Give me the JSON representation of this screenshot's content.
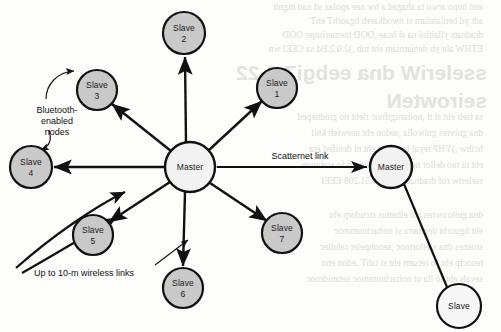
{
  "figure": {
    "name": "bluetooth-piconet-scatternet-diagram",
    "kind": "network-topology-diagram",
    "background_color": "#fdfdfc"
  },
  "colors": {
    "slave_fill": "#c9c9c9",
    "master_fill": "#f2f2f2",
    "node_stroke": "#111111",
    "link_stroke": "#111111",
    "text": "#111111",
    "bleed_text": "#dcdcd7"
  },
  "nodes": [
    {
      "id": "slave2",
      "line1": "Slave",
      "line2": "2",
      "cx": 184,
      "cy": 33,
      "r": 21,
      "role": "slave"
    },
    {
      "id": "slave1",
      "line1": "Slave",
      "line2": "1",
      "cx": 277,
      "cy": 88,
      "r": 20,
      "role": "slave"
    },
    {
      "id": "slave3",
      "line1": "Slave",
      "line2": "3",
      "cx": 97,
      "cy": 90,
      "r": 20,
      "role": "slave"
    },
    {
      "id": "slave4",
      "line1": "Slave",
      "line2": "4",
      "cx": 31,
      "cy": 167,
      "r": 21,
      "role": "slave"
    },
    {
      "id": "slave5",
      "line1": "Slave",
      "line2": "5",
      "cx": 93,
      "cy": 235,
      "r": 20,
      "role": "slave"
    },
    {
      "id": "slave6",
      "line1": "Slave",
      "line2": "6",
      "cx": 183,
      "cy": 288,
      "r": 20,
      "role": "slave"
    },
    {
      "id": "slave7",
      "line1": "Slave",
      "line2": "7",
      "cx": 282,
      "cy": 233,
      "r": 20,
      "role": "slave"
    },
    {
      "id": "master-left",
      "line1": "Master",
      "line2": "",
      "cx": 190,
      "cy": 167,
      "r": 25,
      "role": "master"
    },
    {
      "id": "master-right",
      "line1": "Master",
      "line2": "",
      "cx": 391,
      "cy": 167,
      "r": 21,
      "role": "master"
    },
    {
      "id": "slave-right",
      "line1": "Slave",
      "line2": "",
      "cx": 459,
      "cy": 306,
      "r": 22,
      "role": "slave-open"
    }
  ],
  "labels": {
    "master_left": "Master",
    "master_right": "Master",
    "slave_right": "Slave",
    "slave1_name": "Slave",
    "slave1_num": "1",
    "slave2_name": "Slave",
    "slave2_num": "2",
    "slave3_name": "Slave",
    "slave3_num": "3",
    "slave4_name": "Slave",
    "slave4_num": "4",
    "slave5_name": "Slave",
    "slave5_num": "5",
    "slave6_name": "Slave",
    "slave6_num": "6",
    "slave7_name": "Slave",
    "slave7_num": "7"
  },
  "annotations": {
    "bluetooth_nodes": {
      "line1": "Bluetooth-",
      "line2": "enabled",
      "line3": "nodes",
      "x": 57,
      "y": 110
    },
    "scatternet_link": {
      "text": "Scatternet link",
      "x": 300,
      "y": 158
    },
    "wireless_links": {
      "text": "Up to 10-m wireless links",
      "x": 34,
      "y": 273
    }
  },
  "links": [
    {
      "from": "master-left",
      "to": "slave1",
      "arrow": "to",
      "type": "piconet"
    },
    {
      "from": "master-left",
      "to": "slave2",
      "arrow": "to",
      "type": "piconet"
    },
    {
      "from": "master-left",
      "to": "slave3",
      "arrow": "to",
      "type": "piconet"
    },
    {
      "from": "master-left",
      "to": "slave4",
      "arrow": "to",
      "type": "piconet"
    },
    {
      "from": "master-left",
      "to": "slave5",
      "arrow": "to",
      "type": "piconet"
    },
    {
      "from": "master-left",
      "to": "slave6",
      "arrow": "to",
      "type": "piconet"
    },
    {
      "from": "master-left",
      "to": "slave7",
      "arrow": "to",
      "type": "piconet"
    },
    {
      "from": "master-left",
      "to": "master-right",
      "arrow": "both",
      "type": "scatternet"
    },
    {
      "from": "master-right",
      "to": "slave-right",
      "arrow": "none",
      "type": "piconet"
    }
  ],
  "bleed_through": {
    "note": "faint mirrored show-through text from reverse of scanned page",
    "lines": [
      "the reverse page text is illegible",
      "mirrored body copy fragment",
      "mirrored body copy fragment",
      "mirrored body copy fragment"
    ],
    "heading": "22-3"
  }
}
